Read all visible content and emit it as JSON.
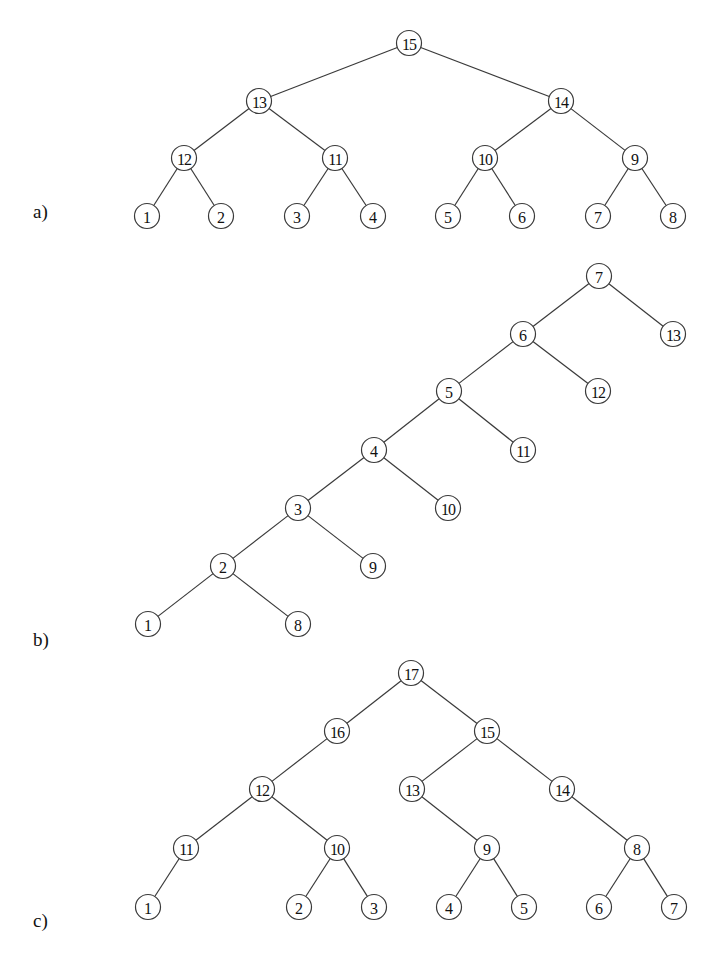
{
  "figure": {
    "node_radius": 12.5,
    "line_color": "#3a3a3a",
    "trees": [
      {
        "id": "a",
        "label": "a)",
        "label_pos": [
          33,
          218
        ],
        "nodes": [
          {
            "id": "15",
            "label": "15",
            "x": 409,
            "y": 43
          },
          {
            "id": "13",
            "label": "13",
            "x": 259,
            "y": 101
          },
          {
            "id": "14",
            "label": "14",
            "x": 561,
            "y": 101
          },
          {
            "id": "12",
            "label": "12",
            "x": 184,
            "y": 158
          },
          {
            "id": "11",
            "label": "11",
            "x": 335,
            "y": 158
          },
          {
            "id": "10",
            "label": "10",
            "x": 485,
            "y": 158
          },
          {
            "id": "9",
            "label": "9",
            "x": 635,
            "y": 158
          },
          {
            "id": "1",
            "label": "1",
            "x": 147,
            "y": 216
          },
          {
            "id": "2",
            "label": "2",
            "x": 221,
            "y": 216
          },
          {
            "id": "3",
            "label": "3",
            "x": 297,
            "y": 216
          },
          {
            "id": "4",
            "label": "4",
            "x": 373,
            "y": 216
          },
          {
            "id": "5",
            "label": "5",
            "x": 448,
            "y": 216
          },
          {
            "id": "6",
            "label": "6",
            "x": 522,
            "y": 216
          },
          {
            "id": "7",
            "label": "7",
            "x": 598,
            "y": 216
          },
          {
            "id": "8",
            "label": "8",
            "x": 673,
            "y": 216
          }
        ],
        "edges": [
          [
            "15",
            "13"
          ],
          [
            "15",
            "14"
          ],
          [
            "13",
            "12"
          ],
          [
            "13",
            "11"
          ],
          [
            "14",
            "10"
          ],
          [
            "14",
            "9"
          ],
          [
            "12",
            "1"
          ],
          [
            "12",
            "2"
          ],
          [
            "11",
            "3"
          ],
          [
            "11",
            "4"
          ],
          [
            "10",
            "5"
          ],
          [
            "10",
            "6"
          ],
          [
            "9",
            "7"
          ],
          [
            "9",
            "8"
          ]
        ]
      },
      {
        "id": "b",
        "label": "b)",
        "label_pos": [
          33,
          646
        ],
        "nodes": [
          {
            "id": "7",
            "label": "7",
            "x": 599,
            "y": 276
          },
          {
            "id": "13",
            "label": "13",
            "x": 673,
            "y": 334
          },
          {
            "id": "6",
            "label": "6",
            "x": 523,
            "y": 334
          },
          {
            "id": "12",
            "label": "12",
            "x": 598,
            "y": 391
          },
          {
            "id": "5",
            "label": "5",
            "x": 449,
            "y": 391
          },
          {
            "id": "11",
            "label": "11",
            "x": 523,
            "y": 450
          },
          {
            "id": "4",
            "label": "4",
            "x": 374,
            "y": 450
          },
          {
            "id": "10",
            "label": "10",
            "x": 448,
            "y": 508
          },
          {
            "id": "3",
            "label": "3",
            "x": 298,
            "y": 508
          },
          {
            "id": "9",
            "label": "9",
            "x": 373,
            "y": 566
          },
          {
            "id": "2",
            "label": "2",
            "x": 223,
            "y": 566
          },
          {
            "id": "1",
            "label": "1",
            "x": 148,
            "y": 624
          },
          {
            "id": "8",
            "label": "8",
            "x": 298,
            "y": 624
          }
        ],
        "edges": [
          [
            "7",
            "6"
          ],
          [
            "7",
            "13"
          ],
          [
            "6",
            "5"
          ],
          [
            "6",
            "12"
          ],
          [
            "5",
            "4"
          ],
          [
            "5",
            "11"
          ],
          [
            "4",
            "3"
          ],
          [
            "4",
            "10"
          ],
          [
            "3",
            "2"
          ],
          [
            "3",
            "9"
          ],
          [
            "2",
            "1"
          ],
          [
            "2",
            "8"
          ]
        ]
      },
      {
        "id": "c",
        "label": "c)",
        "label_pos": [
          33,
          927
        ],
        "nodes": [
          {
            "id": "17",
            "label": "17",
            "x": 411,
            "y": 673
          },
          {
            "id": "16",
            "label": "16",
            "x": 337,
            "y": 731
          },
          {
            "id": "15",
            "label": "15",
            "x": 487,
            "y": 731
          },
          {
            "id": "12",
            "label": "12",
            "x": 262,
            "y": 789
          },
          {
            "id": "13",
            "label": "13",
            "x": 412,
            "y": 789
          },
          {
            "id": "14",
            "label": "14",
            "x": 562,
            "y": 789
          },
          {
            "id": "11",
            "label": "11",
            "x": 186,
            "y": 848
          },
          {
            "id": "10",
            "label": "10",
            "x": 337,
            "y": 848
          },
          {
            "id": "9",
            "label": "9",
            "x": 487,
            "y": 848
          },
          {
            "id": "8",
            "label": "8",
            "x": 637,
            "y": 848
          },
          {
            "id": "1",
            "label": "1",
            "x": 148,
            "y": 907
          },
          {
            "id": "2",
            "label": "2",
            "x": 299,
            "y": 907
          },
          {
            "id": "3",
            "label": "3",
            "x": 374,
            "y": 907
          },
          {
            "id": "4",
            "label": "4",
            "x": 449,
            "y": 907
          },
          {
            "id": "5",
            "label": "5",
            "x": 524,
            "y": 907
          },
          {
            "id": "6",
            "label": "6",
            "x": 599,
            "y": 907
          },
          {
            "id": "7",
            "label": "7",
            "x": 674,
            "y": 907
          }
        ],
        "edges": [
          [
            "17",
            "16"
          ],
          [
            "17",
            "15"
          ],
          [
            "16",
            "12"
          ],
          [
            "15",
            "13"
          ],
          [
            "15",
            "14"
          ],
          [
            "12",
            "11"
          ],
          [
            "12",
            "10"
          ],
          [
            "13",
            "9"
          ],
          [
            "14",
            "8"
          ],
          [
            "11",
            "1"
          ],
          [
            "10",
            "2"
          ],
          [
            "10",
            "3"
          ],
          [
            "9",
            "4"
          ],
          [
            "9",
            "5"
          ],
          [
            "8",
            "6"
          ],
          [
            "8",
            "7"
          ]
        ]
      }
    ]
  }
}
